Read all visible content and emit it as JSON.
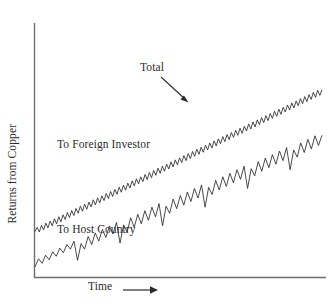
{
  "chart_data": {
    "type": "line",
    "title": "",
    "subtitle": "",
    "xlabel": "Time",
    "ylabel": "Returns from Copper",
    "xlabel_arrow": "⟶",
    "axis_ticks": {
      "x": [],
      "y": []
    },
    "grid": false,
    "legend_position": "inline-annotations",
    "xlim": [
      0,
      100
    ],
    "ylim": [
      0,
      100
    ],
    "annotations": [
      {
        "name": "total",
        "text": "Total",
        "points_to": "upper-curve"
      },
      {
        "name": "foreign-investor",
        "text": "To Foreign Investor",
        "region": "between-curves"
      },
      {
        "name": "host-country",
        "text": "To Host Country",
        "region": "below-lower-curve"
      }
    ],
    "series": [
      {
        "name": "Total",
        "description": "Total returns from copper; small-amplitude sawtooth rising steadily",
        "color": "#2b2b2b",
        "trend_start": 18,
        "trend_end": 74,
        "sawtooth_amplitude": 4,
        "sawtooth_teeth": 44,
        "values": [
          18.0,
          19.6,
          17.8,
          20.4,
          18.6,
          21.3,
          19.4,
          22.1,
          20.2,
          23.0,
          21.0,
          23.8,
          21.8,
          24.6,
          22.7,
          25.5,
          23.5,
          26.3,
          24.3,
          27.1,
          25.2,
          28.0,
          26.0,
          28.8,
          26.8,
          29.6,
          27.7,
          30.5,
          28.5,
          31.3,
          29.3,
          32.1,
          30.2,
          33.0,
          31.0,
          33.8,
          31.8,
          34.6,
          32.7,
          35.5,
          33.5,
          36.3,
          34.3,
          37.1,
          35.2,
          38.0,
          36.0,
          38.8,
          36.8,
          39.6,
          37.7,
          40.5,
          38.5,
          41.3,
          39.3,
          42.1,
          40.2,
          43.0,
          41.0,
          43.8,
          41.8,
          44.6,
          42.7,
          45.5,
          43.5,
          46.3,
          44.3,
          47.1,
          45.2,
          48.0,
          46.0,
          48.8,
          46.8,
          49.6,
          47.7,
          50.5,
          48.5,
          51.3,
          49.3,
          52.1,
          50.2,
          53.0,
          51.0,
          53.8,
          51.8,
          54.6,
          52.7,
          55.5,
          53.5,
          56.3,
          54.3,
          57.1,
          55.2,
          58.0,
          56.0,
          58.8,
          56.8,
          59.6,
          57.7,
          60.5,
          58.5,
          61.3,
          59.3,
          62.1,
          60.2,
          63.0,
          61.0,
          63.8,
          61.8,
          64.6,
          62.7,
          65.5,
          63.5,
          66.3,
          64.3,
          67.1,
          65.2,
          68.0,
          66.0,
          68.8,
          66.8,
          69.6,
          67.7,
          70.5,
          68.5,
          71.3,
          69.3,
          72.1,
          70.2,
          73.0,
          71.0,
          73.8,
          71.8,
          74.0
        ]
      },
      {
        "name": "To Host Country",
        "description": "Returns to host country; larger asymmetric sawtooth with periodic sharp drops, rising faster",
        "color": "#2b2b2b",
        "trend_start": 4,
        "trend_end": 56,
        "sawtooth_amplitude": 6,
        "sawtooth_teeth": 30,
        "drop_every": 6,
        "drop_magnitude": 11,
        "values": [
          4.0,
          7.2,
          5.4,
          8.6,
          6.8,
          10.0,
          8.2,
          11.4,
          9.6,
          12.8,
          11.0,
          14.2,
          6.6,
          13.2,
          11.0,
          16.0,
          12.8,
          17.4,
          14.2,
          18.8,
          15.6,
          20.2,
          17.0,
          21.6,
          13.4,
          20.6,
          17.8,
          23.4,
          19.6,
          24.8,
          21.0,
          26.2,
          22.4,
          27.6,
          23.8,
          29.0,
          20.2,
          28.0,
          25.2,
          30.8,
          27.0,
          32.2,
          28.4,
          33.6,
          29.8,
          35.0,
          31.2,
          36.4,
          27.6,
          35.4,
          32.6,
          38.2,
          34.4,
          39.6,
          35.8,
          41.0,
          37.2,
          42.4,
          38.6,
          43.8,
          35.0,
          42.8,
          40.0,
          45.6,
          41.8,
          47.0,
          43.2,
          48.4,
          44.6,
          49.8,
          46.0,
          51.2,
          42.4,
          50.2,
          47.4,
          53.0,
          49.2,
          54.4,
          50.6,
          55.8,
          52.0,
          56.0
        ]
      }
    ]
  },
  "labels": {
    "total": "Total",
    "foreign_investor": "To Foreign Investor",
    "host_country": "To Host Country",
    "x_axis": "Time",
    "y_axis": "Returns from Copper"
  },
  "colors": {
    "line": "#2b2b2b",
    "axis": "#6d6d6d",
    "background": "#ffffff",
    "text": "#2b2b2b"
  }
}
